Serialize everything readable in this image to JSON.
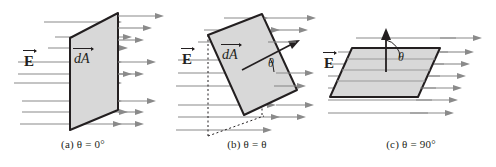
{
  "figure": {
    "background_color": "#ffffff",
    "surface_fill_color": "#d8d8d8",
    "surface_edge_color": "#231f20",
    "field_line_color": "#808080",
    "line_color": "#231f20"
  },
  "panels": [
    {
      "id": "a",
      "caption": "(a) θ = 0°",
      "caption_prefix": "(a)",
      "angle_symbol": "θ",
      "angle_value": "0°",
      "field_label": "E",
      "area_label": "dA",
      "surface_orientation": "perpendicular-to-field",
      "normal_vector_shown": false,
      "angle_arc_shown": false,
      "field_line_count": 8,
      "description": "Vertical planar surface with field lines passing straight through"
    },
    {
      "id": "b",
      "caption": "(b) θ = θ",
      "caption_prefix": "(b)",
      "angle_symbol": "θ",
      "angle_value": "θ",
      "field_label": "E",
      "area_label": "dA",
      "angle_label": "θ",
      "surface_orientation": "tilted",
      "normal_vector_shown": true,
      "angle_arc_shown": true,
      "projection_lines_shown": true,
      "field_line_count": 8,
      "description": "Tilted planar surface with normal vector at angle theta to the field"
    },
    {
      "id": "c",
      "caption": "(c) θ = 90°",
      "caption_prefix": "(c)",
      "angle_symbol": "θ",
      "angle_value": "90°",
      "field_label": "E",
      "angle_label": "θ",
      "surface_orientation": "parallel-to-field",
      "normal_vector_shown": true,
      "angle_arc_shown": true,
      "field_line_count": 7,
      "description": "Horizontal planar surface edge-on to the field with vertical normal vector"
    }
  ]
}
